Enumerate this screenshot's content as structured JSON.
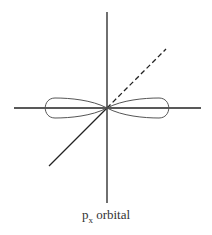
{
  "diagram": {
    "caption": {
      "main": "p",
      "subscript": "x",
      "suffix": " orbital"
    },
    "elements": {
      "axes": [
        "x-axis (horizontal)",
        "y-axis (vertical)",
        "z-axis (diagonal, dashed behind)"
      ],
      "lobes": [
        "left lobe",
        "right lobe"
      ]
    },
    "colors": {
      "axis": "#222222",
      "lobe": "#555555",
      "text": "#333333"
    }
  }
}
